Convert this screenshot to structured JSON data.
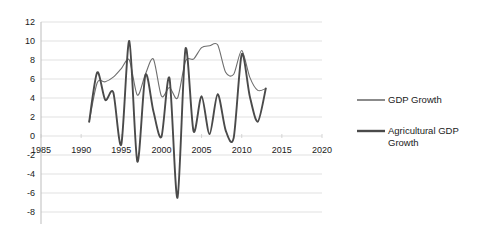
{
  "chart_data": {
    "type": "line",
    "title": "",
    "xlabel": "",
    "ylabel": "",
    "xlim": [
      1985,
      2020
    ],
    "ylim": [
      -8,
      12
    ],
    "grid": true,
    "legend_position": "right",
    "xticks": [
      1985,
      1990,
      1995,
      2000,
      2005,
      2010,
      2015,
      2020
    ],
    "yticks": [
      12,
      10,
      8,
      6,
      4,
      2,
      0,
      -2,
      -4,
      -6,
      -8
    ],
    "x": [
      1991,
      1992,
      1993,
      1994,
      1995,
      1996,
      1997,
      1998,
      1999,
      2000,
      2001,
      2002,
      2003,
      2004,
      2005,
      2006,
      2007,
      2008,
      2009,
      2010,
      2011,
      2012,
      2013
    ],
    "series": [
      {
        "name": "GDP Growth",
        "color": "#6e6e6e",
        "width": 1.1,
        "values": [
          1.5,
          5.6,
          5.7,
          6.2,
          7.1,
          8.0,
          4.3,
          6.5,
          8.1,
          4.2,
          5.1,
          4.0,
          7.9,
          8.1,
          9.3,
          9.5,
          9.6,
          6.7,
          6.5,
          9.0,
          6.2,
          4.8,
          5.0
        ]
      },
      {
        "name": "Agricultural GDP Growth",
        "color": "#4a4a4a",
        "width": 1.9,
        "values": [
          1.5,
          6.7,
          3.8,
          4.6,
          -0.9,
          10.0,
          -2.7,
          6.4,
          2.6,
          -0.1,
          6.1,
          -6.5,
          9.2,
          0.5,
          4.2,
          0.2,
          4.4,
          0.6,
          -0.2,
          8.6,
          4.2,
          1.5,
          5.0
        ]
      }
    ]
  },
  "legend": {
    "items": [
      {
        "label": "GDP Growth"
      },
      {
        "label": "Agricultural GDP",
        "label2": "Growth"
      }
    ]
  }
}
